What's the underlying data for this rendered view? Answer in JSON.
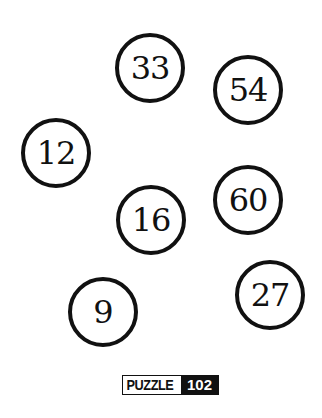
{
  "circles": [
    {
      "value": "33",
      "cx": 150,
      "cy": 68
    },
    {
      "value": "54",
      "cx": 248,
      "cy": 90
    },
    {
      "value": "12",
      "cx": 56,
      "cy": 153
    },
    {
      "value": "60",
      "cx": 248,
      "cy": 200
    },
    {
      "value": "16",
      "cx": 151,
      "cy": 220
    },
    {
      "value": "27",
      "cx": 270,
      "cy": 295
    },
    {
      "value": "9",
      "cx": 103,
      "cy": 312
    }
  ],
  "badge": {
    "word": "PUZZLE",
    "number": "102"
  }
}
